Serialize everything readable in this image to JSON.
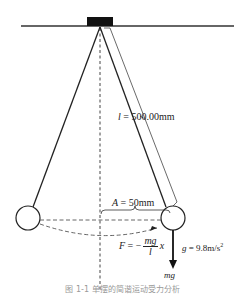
{
  "diagram": {
    "type": "simple-pendulum",
    "labels": {
      "length_var": "l",
      "length_value": " = 500.00mm",
      "amplitude_var": "A",
      "amplitude_value": " = 50mm",
      "gravity_var": "g",
      "gravity_value": " = 9.8m/s",
      "gravity_exp": "2",
      "force_var": "F",
      "force_eq": " = −",
      "force_num": "mg",
      "force_den": "l",
      "force_x": "x",
      "weight": "mg"
    },
    "caption": "图 1-1  单摆的简谐运动受力分析",
    "colors": {
      "line": "#222222",
      "support": "#111111",
      "dashed": "#555555"
    }
  }
}
